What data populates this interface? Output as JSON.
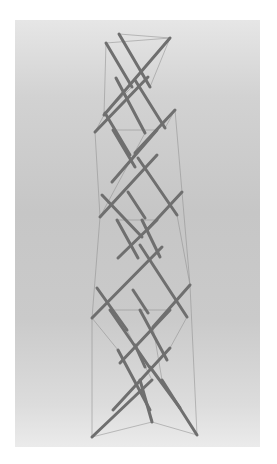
{
  "image": {
    "subject": "tensegrity-tower-sculpture",
    "background_color": "#c8c8c8",
    "border_color": "#ffffff",
    "strut_color": "#6f6f6f",
    "cable_color": "#8c8c8c",
    "struts": [
      [
        106,
        43,
        132,
        87
      ],
      [
        119,
        34,
        150,
        87
      ],
      [
        170,
        38,
        104,
        115
      ],
      [
        116,
        78,
        145,
        133
      ],
      [
        135,
        80,
        165,
        128
      ],
      [
        148,
        77,
        95,
        132
      ],
      [
        175,
        110,
        135,
        153
      ],
      [
        105,
        113,
        130,
        155
      ],
      [
        113,
        130,
        135,
        167
      ],
      [
        157,
        130,
        112,
        182
      ],
      [
        138,
        158,
        177,
        215
      ],
      [
        157,
        155,
        100,
        217
      ],
      [
        102,
        195,
        142,
        237
      ],
      [
        128,
        192,
        145,
        218
      ],
      [
        182,
        192,
        147,
        230
      ],
      [
        117,
        220,
        138,
        258
      ],
      [
        142,
        220,
        160,
        257
      ],
      [
        157,
        220,
        118,
        258
      ],
      [
        140,
        245,
        187,
        317
      ],
      [
        162,
        247,
        92,
        318
      ],
      [
        97,
        288,
        127,
        330
      ],
      [
        133,
        290,
        148,
        313
      ],
      [
        190,
        285,
        153,
        327
      ],
      [
        110,
        310,
        150,
        368
      ],
      [
        140,
        310,
        167,
        360
      ],
      [
        170,
        310,
        120,
        363
      ],
      [
        118,
        350,
        150,
        410
      ],
      [
        170,
        348,
        113,
        410
      ],
      [
        135,
        345,
        145,
        367
      ],
      [
        150,
        367,
        180,
        408
      ],
      [
        152,
        380,
        92,
        437
      ],
      [
        140,
        380,
        152,
        422
      ],
      [
        162,
        380,
        197,
        435
      ]
    ],
    "cables": [
      [
        106,
        43,
        170,
        38
      ],
      [
        119,
        34,
        170,
        38
      ],
      [
        106,
        43,
        104,
        115
      ],
      [
        170,
        38,
        150,
        87
      ],
      [
        104,
        115,
        95,
        132
      ],
      [
        165,
        128,
        175,
        110
      ],
      [
        95,
        132,
        100,
        217
      ],
      [
        175,
        110,
        182,
        192
      ],
      [
        100,
        217,
        92,
        318
      ],
      [
        182,
        192,
        190,
        285
      ],
      [
        92,
        318,
        92,
        437
      ],
      [
        190,
        285,
        197,
        435
      ],
      [
        92,
        437,
        152,
        422
      ],
      [
        152,
        422,
        197,
        435
      ],
      [
        113,
        130,
        157,
        130
      ],
      [
        117,
        220,
        157,
        220
      ],
      [
        110,
        310,
        170,
        310
      ],
      [
        92,
        318,
        118,
        350
      ],
      [
        187,
        317,
        170,
        348
      ],
      [
        132,
        87,
        104,
        115
      ],
      [
        145,
        133,
        100,
        217
      ],
      [
        177,
        215,
        190,
        285
      ],
      [
        127,
        330,
        152,
        380
      ],
      [
        153,
        327,
        162,
        380
      ]
    ]
  }
}
